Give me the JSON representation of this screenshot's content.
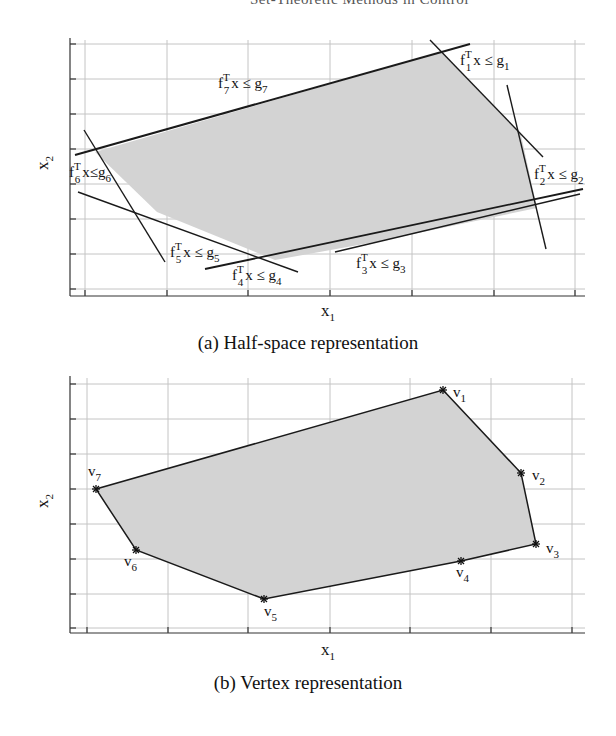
{
  "page": {
    "running_head": "Set-Theoretic Methods in Control"
  },
  "figure_a": {
    "caption": "(a) Half-space representation",
    "xlabel": "x",
    "xlabel_sub": "1",
    "ylabel": "x",
    "ylabel_sub": "2",
    "constraints": [
      {
        "id": "1",
        "label_f": "f",
        "label_sub": "1",
        "label_rest": "x ≤ g",
        "g_sub": "1"
      },
      {
        "id": "2",
        "label_f": "f",
        "label_sub": "2",
        "label_rest": "x ≤ g",
        "g_sub": "2"
      },
      {
        "id": "3",
        "label_f": "f",
        "label_sub": "3",
        "label_rest": "x ≤ g",
        "g_sub": "3"
      },
      {
        "id": "4",
        "label_f": "f",
        "label_sub": "4",
        "label_rest": "x ≤ g",
        "g_sub": "4"
      },
      {
        "id": "5",
        "label_f": "f",
        "label_sub": "5",
        "label_rest": "x ≤ g",
        "g_sub": "5"
      },
      {
        "id": "6",
        "label_f": "f",
        "label_sub": "6",
        "label_rest": "x≤g",
        "g_sub": "6"
      },
      {
        "id": "7",
        "label_f": "f",
        "label_sub": "7",
        "label_rest": "x ≤ g",
        "g_sub": "7"
      }
    ],
    "superscript": "T"
  },
  "figure_b": {
    "caption": "(b) Vertex representation",
    "xlabel": "x",
    "xlabel_sub": "1",
    "ylabel": "x",
    "ylabel_sub": "2",
    "vertices": [
      {
        "name": "v",
        "sub": "1"
      },
      {
        "name": "v",
        "sub": "2"
      },
      {
        "name": "v",
        "sub": "3"
      },
      {
        "name": "v",
        "sub": "4"
      },
      {
        "name": "v",
        "sub": "5"
      },
      {
        "name": "v",
        "sub": "6"
      },
      {
        "name": "v",
        "sub": "7"
      }
    ]
  },
  "colors": {
    "polytope_fill": "#d6d6d6",
    "edge": "#1a1a1a",
    "grid": "#bdbdbd"
  }
}
